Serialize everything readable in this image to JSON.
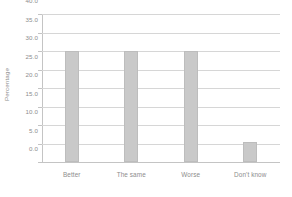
{
  "chart_data": {
    "type": "bar",
    "title": "",
    "subtitle": "",
    "xlabel": "",
    "ylabel": "Percentage",
    "categories": [
      "Better",
      "The same",
      "Worse",
      "Don't know"
    ],
    "values": [
      30.0,
      30.0,
      30.0,
      5.5
    ],
    "series": [
      {
        "name": "Percentage",
        "values": [
          30.0,
          30.0,
          30.0,
          5.5
        ]
      }
    ],
    "ylim": [
      0.0,
      40.0
    ],
    "ytick_step": 5.0,
    "ytick_labels": [
      "0.0",
      "5.0",
      "10.0",
      "15.0",
      "20.0",
      "25.0",
      "30.0",
      "35.0",
      "40.0"
    ],
    "ytick_values": [
      0.0,
      5.0,
      10.0,
      15.0,
      20.0,
      25.0,
      30.0,
      35.0,
      40.0
    ],
    "grid": true,
    "grid_axis": "y",
    "legend": false,
    "legend_position": "none",
    "bar_color": "#c9c9c9",
    "bar_border_color": "#bdbdbd",
    "gridline_color": "#d6d6d6",
    "axis_color": "#c4c4c4",
    "text_color": "#8d8d8d",
    "background_color": "#ffffff",
    "annotations": []
  }
}
